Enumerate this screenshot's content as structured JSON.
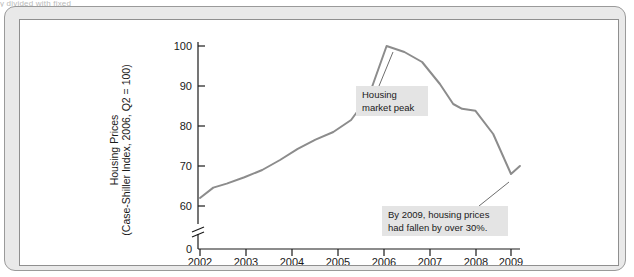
{
  "top_caption": "y divided with fixed",
  "chart_data": {
    "type": "line",
    "title": "",
    "xlabel": "",
    "ylabel_line1": "Housing Prices",
    "ylabel_line2": "(Case-Shiller Index, 2006, Q2 = 100)",
    "x_ticks": [
      "2002",
      "2003",
      "2004",
      "2005",
      "2006",
      "2007",
      "2008",
      "2009"
    ],
    "y_ticks": [
      "0",
      "60",
      "70",
      "80",
      "90",
      "100"
    ],
    "y_axis_break": true,
    "ylim": [
      58,
      102
    ],
    "xlim": [
      2002,
      2009.3
    ],
    "grid": false,
    "legend": "none",
    "line_color": "#8c8c8c",
    "x": [
      2002.0,
      2002.3,
      2002.6,
      2003.0,
      2003.4,
      2003.8,
      2004.2,
      2004.6,
      2005.0,
      2005.4,
      2005.8,
      2006.2,
      2006.6,
      2007.0,
      2007.4,
      2007.7,
      2007.9,
      2008.2,
      2008.6,
      2009.0,
      2009.2
    ],
    "values": [
      62.0,
      64.6,
      65.6,
      67.2,
      69.0,
      71.5,
      74.3,
      76.6,
      78.5,
      81.5,
      87.5,
      100.0,
      98.5,
      96.0,
      90.5,
      85.5,
      84.3,
      83.8,
      78.0,
      68.0,
      70.0
    ],
    "annotations": [
      {
        "name": "housing-market-peak",
        "line1": "Housing",
        "line2": "market peak",
        "points_to_x": 2006.2,
        "points_to_y": 100.0
      },
      {
        "name": "price-decline-note",
        "line1": "By 2009, housing prices",
        "line2": "had fallen by over 30%.",
        "points_to_x": 2009.0,
        "points_to_y": 68.0
      }
    ]
  }
}
